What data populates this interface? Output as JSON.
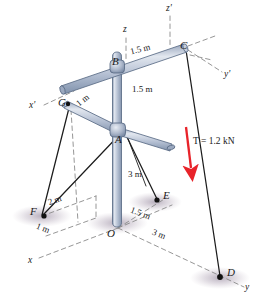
{
  "figure": {
    "background_color": "#ffffff"
  },
  "colors": {
    "member_fill": "#b9c4d6",
    "member_fill_light": "#d6dde8",
    "member_edge": "#5a6b85",
    "cable": "#1c1c1c",
    "axis_dashed": "#8a8a8a",
    "force_arrow": "#e8232a",
    "shadow": "#b2a8b6",
    "label_text": "#1a1a1a"
  },
  "axes": [
    {
      "name": "z",
      "label": "z",
      "style": "dashed",
      "x": 123,
      "y": 31
    },
    {
      "name": "z'",
      "label": "z'",
      "style": "dashed",
      "x": 166,
      "y": 9
    },
    {
      "name": "y'",
      "label": "y'",
      "style": "dashed",
      "x": 226,
      "y": 77
    },
    {
      "name": "x'",
      "label": "x'",
      "style": "dashed",
      "x": 33,
      "y": 109
    },
    {
      "name": "x",
      "label": "x",
      "style": "dashed",
      "x": 31,
      "y": 263
    },
    {
      "name": "y",
      "label": "y",
      "style": "dashed",
      "x": 247,
      "y": 290
    }
  ],
  "points": [
    {
      "name": "A",
      "label": "A",
      "x": 118,
      "y": 133
    },
    {
      "name": "B",
      "label": "B",
      "x": 113,
      "y": 62
    },
    {
      "name": "C",
      "label": "C",
      "x": 183,
      "y": 47
    },
    {
      "name": "D",
      "label": "D",
      "x": 226,
      "y": 273
    },
    {
      "name": "E",
      "label": "E",
      "x": 161,
      "y": 198
    },
    {
      "name": "F",
      "label": "F",
      "x": 37,
      "y": 215
    },
    {
      "name": "G",
      "label": "G",
      "x": 64,
      "y": 104
    },
    {
      "name": "O",
      "label": "O",
      "x": 115,
      "y": 230
    }
  ],
  "dimensions": [
    {
      "name": "bc-length",
      "label": "1.5 m",
      "x": 134,
      "y": 52,
      "rotate": -13
    },
    {
      "name": "ba-height",
      "label": "1.5 m",
      "x": 135,
      "y": 91,
      "rotate": 0
    },
    {
      "name": "ga-length",
      "label": "1 m",
      "x": 82,
      "y": 100,
      "rotate": -35
    },
    {
      "name": "pole-height",
      "label": "3 m",
      "x": 131,
      "y": 175,
      "rotate": 0
    },
    {
      "name": "oe-distance",
      "label": "1.5 m",
      "x": 139,
      "y": 214,
      "rotate": 20
    },
    {
      "name": "of-x",
      "label": "2 m",
      "x": 52,
      "y": 202,
      "rotate": -18
    },
    {
      "name": "of-y",
      "label": "1 m",
      "x": 40,
      "y": 231,
      "rotate": 20
    },
    {
      "name": "od-distance",
      "label": "3 m",
      "x": 157,
      "y": 236,
      "rotate": 20
    }
  ],
  "force": {
    "name": "applied-tension",
    "label": "T = 1.2 kN",
    "symbol": "T",
    "value": "1.2",
    "unit": "kN",
    "color": "#e8232a",
    "label_x": 195,
    "label_y": 143,
    "direction": "downward"
  },
  "members": [
    {
      "name": "vertical-pole",
      "from": "top",
      "to": "O"
    },
    {
      "name": "upper-boom",
      "from": "left-tip",
      "through": "B",
      "to": "C"
    },
    {
      "name": "lower-boom-left",
      "from": "G",
      "to": "A"
    },
    {
      "name": "lower-boom-right",
      "from": "A",
      "to": "right-tip"
    }
  ],
  "cables": [
    {
      "name": "cable-G-F",
      "from": "G",
      "to": "F"
    },
    {
      "name": "cable-A-F",
      "from": "A",
      "to": "F"
    },
    {
      "name": "cable-A-E",
      "from": "A",
      "to": "E"
    },
    {
      "name": "cable-C-D",
      "from": "C",
      "to": "D"
    }
  ]
}
